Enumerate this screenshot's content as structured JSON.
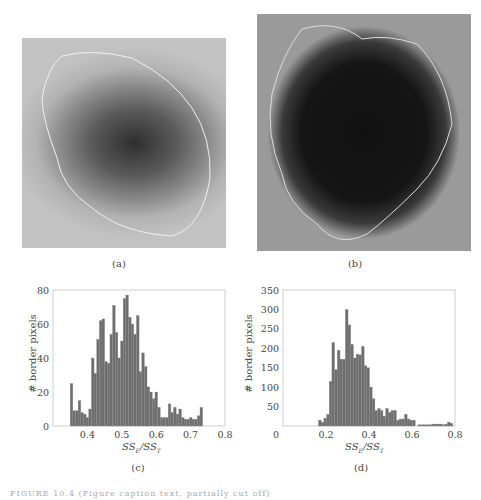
{
  "panels": {
    "a": {
      "label": "(a)"
    },
    "b": {
      "label": "(b)"
    },
    "c": {
      "label": "(c)"
    },
    "d": {
      "label": "(d)"
    }
  },
  "caption": "FIGURE 10.4  (Figure caption text, partially cut off)",
  "chart_data": [
    {
      "type": "bar",
      "panel": "(c)",
      "title": "",
      "xlabel": "SS_E/SS_T",
      "ylabel": "# border pixels",
      "xlim": [
        0.3,
        0.8
      ],
      "ylim": [
        0,
        80
      ],
      "xticks": [
        0.4,
        0.5,
        0.6,
        0.7,
        0.8
      ],
      "yticks": [
        0,
        20,
        40,
        60,
        80
      ],
      "grid": false,
      "bin_start": 0.35,
      "bin_width": 0.0077,
      "values": [
        25,
        9,
        9,
        15,
        8,
        7,
        5,
        10,
        40,
        31,
        51,
        62,
        63,
        38,
        37,
        54,
        71,
        55,
        40,
        50,
        75,
        77,
        64,
        60,
        54,
        65,
        32,
        43,
        35,
        23,
        20,
        16,
        20,
        11,
        5,
        5,
        5,
        13,
        8,
        11,
        7,
        10,
        5,
        4,
        4,
        5,
        4,
        4,
        6,
        11
      ]
    },
    {
      "type": "bar",
      "panel": "(d)",
      "title": "",
      "xlabel": "SS_E/SS_T",
      "ylabel": "# border pixels",
      "xlim": [
        0,
        0.8
      ],
      "ylim": [
        0,
        350
      ],
      "xticks": [
        0,
        0.2,
        0.4,
        0.6,
        0.8
      ],
      "yticks": [
        0,
        50,
        100,
        150,
        200,
        250,
        300,
        350
      ],
      "grid": false,
      "bin_start": 0.165,
      "bin_width": 0.0125,
      "values": [
        15,
        10,
        20,
        30,
        115,
        215,
        145,
        195,
        172,
        172,
        300,
        260,
        210,
        175,
        185,
        183,
        205,
        155,
        150,
        100,
        70,
        40,
        45,
        40,
        25,
        45,
        35,
        40,
        40,
        15,
        18,
        18,
        30,
        18,
        15,
        15,
        0,
        3,
        3,
        3,
        3,
        3,
        5,
        5,
        5,
        5,
        3,
        5,
        10,
        7
      ]
    }
  ]
}
